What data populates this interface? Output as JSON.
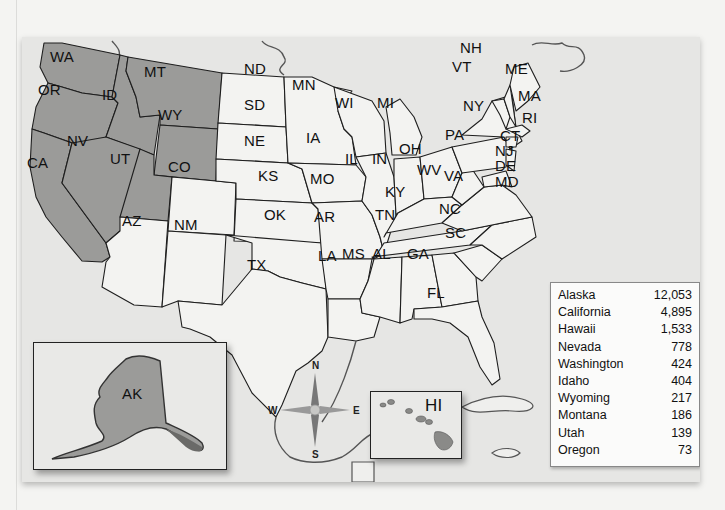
{
  "map": {
    "shaded_color": "#9b9b99",
    "plain_color": "#f3f3f1",
    "states": [
      {
        "abbr": "WA",
        "shaded": true
      },
      {
        "abbr": "OR",
        "shaded": true
      },
      {
        "abbr": "CA",
        "shaded": true
      },
      {
        "abbr": "ID",
        "shaded": true
      },
      {
        "abbr": "NV",
        "shaded": true
      },
      {
        "abbr": "MT",
        "shaded": true
      },
      {
        "abbr": "WY",
        "shaded": true
      },
      {
        "abbr": "UT",
        "shaded": true
      },
      {
        "abbr": "AK",
        "shaded": true
      },
      {
        "abbr": "HI",
        "shaded": true
      },
      {
        "abbr": "AZ",
        "shaded": false
      },
      {
        "abbr": "NM",
        "shaded": false
      },
      {
        "abbr": "CO",
        "shaded": false
      },
      {
        "abbr": "ND",
        "shaded": false
      },
      {
        "abbr": "SD",
        "shaded": false
      },
      {
        "abbr": "NE",
        "shaded": false
      },
      {
        "abbr": "KS",
        "shaded": false
      },
      {
        "abbr": "OK",
        "shaded": false
      },
      {
        "abbr": "TX",
        "shaded": false
      },
      {
        "abbr": "MN",
        "shaded": false
      },
      {
        "abbr": "IA",
        "shaded": false
      },
      {
        "abbr": "MO",
        "shaded": false
      },
      {
        "abbr": "AR",
        "shaded": false
      },
      {
        "abbr": "LA",
        "shaded": false
      },
      {
        "abbr": "WI",
        "shaded": false
      },
      {
        "abbr": "IL",
        "shaded": false
      },
      {
        "abbr": "MI",
        "shaded": false
      },
      {
        "abbr": "IN",
        "shaded": false
      },
      {
        "abbr": "OH",
        "shaded": false
      },
      {
        "abbr": "KY",
        "shaded": false
      },
      {
        "abbr": "TN",
        "shaded": false
      },
      {
        "abbr": "MS",
        "shaded": false
      },
      {
        "abbr": "AL",
        "shaded": false
      },
      {
        "abbr": "GA",
        "shaded": false
      },
      {
        "abbr": "FL",
        "shaded": false
      },
      {
        "abbr": "SC",
        "shaded": false
      },
      {
        "abbr": "NC",
        "shaded": false
      },
      {
        "abbr": "VA",
        "shaded": false
      },
      {
        "abbr": "WV",
        "shaded": false
      },
      {
        "abbr": "PA",
        "shaded": false
      },
      {
        "abbr": "NY",
        "shaded": false
      },
      {
        "abbr": "VT",
        "shaded": false
      },
      {
        "abbr": "NH",
        "shaded": false
      },
      {
        "abbr": "ME",
        "shaded": false
      },
      {
        "abbr": "MA",
        "shaded": false
      },
      {
        "abbr": "RI",
        "shaded": false
      },
      {
        "abbr": "CT",
        "shaded": false
      },
      {
        "abbr": "NJ",
        "shaded": false
      },
      {
        "abbr": "DE",
        "shaded": false
      },
      {
        "abbr": "MD",
        "shaded": false
      }
    ],
    "labels": {
      "WA": "WA",
      "OR": "OR",
      "CA": "CA",
      "ID": "ID",
      "NV": "NV",
      "MT": "MT",
      "WY": "WY",
      "UT": "UT",
      "AZ": "AZ",
      "NM": "NM",
      "CO": "CO",
      "ND": "ND",
      "SD": "SD",
      "NE": "NE",
      "KS": "KS",
      "OK": "OK",
      "TX": "TX",
      "MN": "MN",
      "IA": "IA",
      "MO": "MO",
      "AR": "AR",
      "LA": "LA",
      "WI": "WI",
      "IL": "IL",
      "MI": "MI",
      "IN": "IN",
      "OH": "OH",
      "KY": "KY",
      "TN": "TN",
      "MS": "MS",
      "AL": "AL",
      "GA": "GA",
      "FL": "FL",
      "SC": "SC",
      "NC": "NC",
      "VA": "VA",
      "WV": "WV",
      "PA": "PA",
      "NY": "NY",
      "VT": "VT",
      "NH": "NH",
      "ME": "ME",
      "MA": "MA",
      "RI": "RI",
      "CT": "CT",
      "NJ": "NJ",
      "DE": "DE",
      "MD": "MD",
      "AK": "AK",
      "HI": "HI"
    }
  },
  "compass": {
    "n": "N",
    "s": "S",
    "e": "E",
    "w": "W",
    "icon": "compass-rose-icon"
  },
  "legend": {
    "rows": [
      {
        "state": "Alaska",
        "value": "12,053"
      },
      {
        "state": "California",
        "value": "4,895"
      },
      {
        "state": "Hawaii",
        "value": "1,533"
      },
      {
        "state": "Nevada",
        "value": "778"
      },
      {
        "state": "Washington",
        "value": "424"
      },
      {
        "state": "Idaho",
        "value": "404"
      },
      {
        "state": "Wyoming",
        "value": "217"
      },
      {
        "state": "Montana",
        "value": "186"
      },
      {
        "state": "Utah",
        "value": "139"
      },
      {
        "state": "Oregon",
        "value": "73"
      }
    ]
  }
}
